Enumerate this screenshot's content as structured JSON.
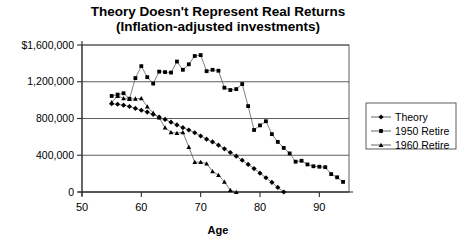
{
  "chart_data": {
    "type": "line",
    "title": "Theory Doesn't Represent Real Returns",
    "subtitle": "(Inflation-adjusted investments)",
    "xlabel": "Age",
    "ylabel": "",
    "xlim": [
      50,
      95
    ],
    "ylim": [
      0,
      1600000
    ],
    "xticks": [
      50,
      60,
      70,
      80,
      90
    ],
    "xtick_labels": [
      "50",
      "60",
      "70",
      "80",
      "90"
    ],
    "yticks": [
      0,
      400000,
      800000,
      1200000,
      1600000
    ],
    "ytick_labels": [
      "0",
      "400,000",
      "800,000",
      "1,200,000",
      "$1,600,000"
    ],
    "grid": true,
    "legend_position": "right",
    "series": [
      {
        "name": "Theory",
        "marker": "diamond",
        "x": [
          55,
          56,
          57,
          58,
          59,
          60,
          61,
          62,
          63,
          64,
          65,
          66,
          67,
          68,
          69,
          70,
          71,
          72,
          73,
          74,
          75,
          76,
          77,
          78,
          79,
          80,
          81,
          82,
          83,
          84
        ],
        "values": [
          960000,
          955000,
          945000,
          930000,
          910000,
          890000,
          870000,
          845000,
          815000,
          790000,
          760000,
          730000,
          700000,
          675000,
          645000,
          610000,
          575000,
          545000,
          510000,
          470000,
          430000,
          390000,
          345000,
          300000,
          255000,
          205000,
          155000,
          105000,
          50000,
          0
        ]
      },
      {
        "name": "1950 Retire",
        "marker": "square",
        "x": [
          55,
          56,
          57,
          58,
          59,
          60,
          61,
          62,
          63,
          64,
          65,
          66,
          67,
          68,
          69,
          70,
          71,
          72,
          73,
          74,
          75,
          76,
          77,
          78,
          79,
          80,
          81,
          82,
          83,
          84,
          85,
          86,
          87,
          88,
          89,
          90,
          91,
          92,
          93,
          94
        ],
        "values": [
          1045000,
          1060000,
          1075000,
          1015000,
          1240000,
          1370000,
          1250000,
          1180000,
          1310000,
          1305000,
          1300000,
          1420000,
          1330000,
          1390000,
          1480000,
          1490000,
          1315000,
          1330000,
          1320000,
          1135000,
          1110000,
          1120000,
          1175000,
          935000,
          675000,
          725000,
          770000,
          630000,
          545000,
          480000,
          420000,
          330000,
          340000,
          300000,
          280000,
          275000,
          270000,
          195000,
          160000,
          110000
        ]
      },
      {
        "name": "1960 Retire",
        "marker": "triangle",
        "x": [
          55,
          56,
          57,
          58,
          59,
          60,
          61,
          62,
          63,
          64,
          65,
          66,
          67,
          68,
          69,
          70,
          71,
          72,
          73,
          74,
          75,
          76
        ],
        "values": [
          975000,
          1045000,
          1020000,
          1010000,
          1015000,
          1020000,
          930000,
          860000,
          810000,
          700000,
          650000,
          640000,
          650000,
          490000,
          325000,
          325000,
          310000,
          225000,
          185000,
          110000,
          20000,
          0
        ]
      }
    ]
  }
}
